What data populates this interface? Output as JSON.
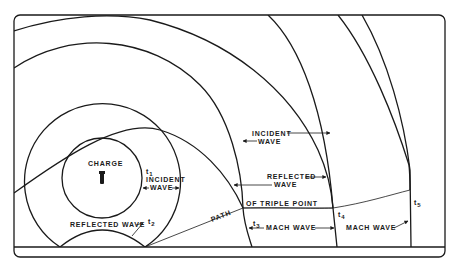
{
  "labels": {
    "charge": "CHARGE",
    "incident_wave_inner_1": "INCIDENT",
    "incident_wave_inner_2": "WAVE",
    "incident_wave_outer_1": "INCIDENT",
    "incident_wave_outer_2": "WAVE",
    "reflected_wave_1": "REFLECTED",
    "reflected_wave_2": "WAVE",
    "reflected_wave_ground": "REFLECTED WAVE",
    "path_part1": "PATH",
    "path_part2": "OF TRIPLE POINT",
    "mach_wave_1": "MACH WAVE",
    "mach_wave_2": "MACH WAVE"
  },
  "time_marks": {
    "t1": "t",
    "t1_sub": "1",
    "t2": "t",
    "t2_sub": "2",
    "t3": "t",
    "t3_sub": "3",
    "t4": "t",
    "t4_sub": "4",
    "t5": "t",
    "t5_sub": "5"
  },
  "colors": {
    "ink": "#1a1a1a",
    "background": "#ffffff"
  }
}
